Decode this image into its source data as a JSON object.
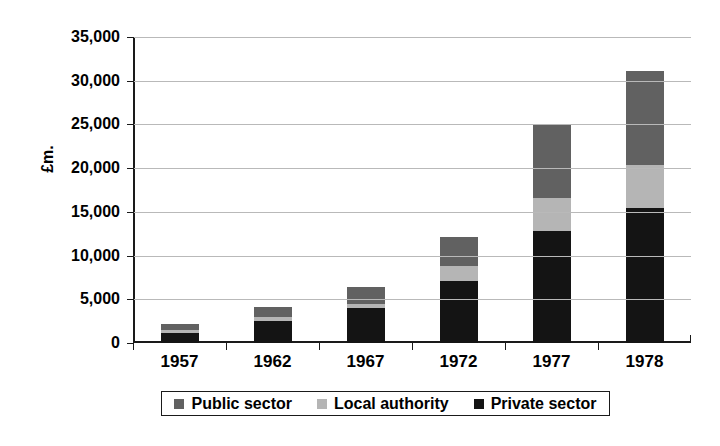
{
  "chart_data": {
    "type": "bar",
    "stacked": true,
    "title": "",
    "xlabel": "",
    "ylabel": "£m.",
    "ylim": [
      0,
      35000
    ],
    "ytick_step": 5000,
    "ytick_labels": [
      "0",
      "5,000",
      "10,000",
      "15,000",
      "20,000",
      "25,000",
      "30,000",
      "35,000"
    ],
    "ytick_values": [
      0,
      5000,
      10000,
      15000,
      20000,
      25000,
      30000,
      35000
    ],
    "grid": true,
    "legend_position": "bottom",
    "categories": [
      "1957",
      "1962",
      "1967",
      "1972",
      "1977",
      "1978"
    ],
    "series": [
      {
        "name": "Private sector",
        "color": "#141414",
        "values": [
          1150,
          2500,
          3950,
          7050,
          12800,
          15450
        ]
      },
      {
        "name": "Local authority",
        "color": "#b5b5b5",
        "values": [
          350,
          450,
          500,
          1750,
          3800,
          4900
        ]
      },
      {
        "name": "Public sector",
        "color": "#616161",
        "values": [
          650,
          1200,
          2000,
          3300,
          8400,
          10800
        ]
      }
    ],
    "totals": [
      2150,
      4150,
      6450,
      12100,
      25000,
      31150
    ]
  },
  "legend": {
    "items": [
      {
        "label": "Public sector",
        "color": "#616161",
        "swatch_name": "legend-swatch-public-sector"
      },
      {
        "label": "Local authority",
        "color": "#b5b5b5",
        "swatch_name": "legend-swatch-local-authority"
      },
      {
        "label": "Private sector",
        "color": "#141414",
        "swatch_name": "legend-swatch-private-sector"
      }
    ]
  }
}
